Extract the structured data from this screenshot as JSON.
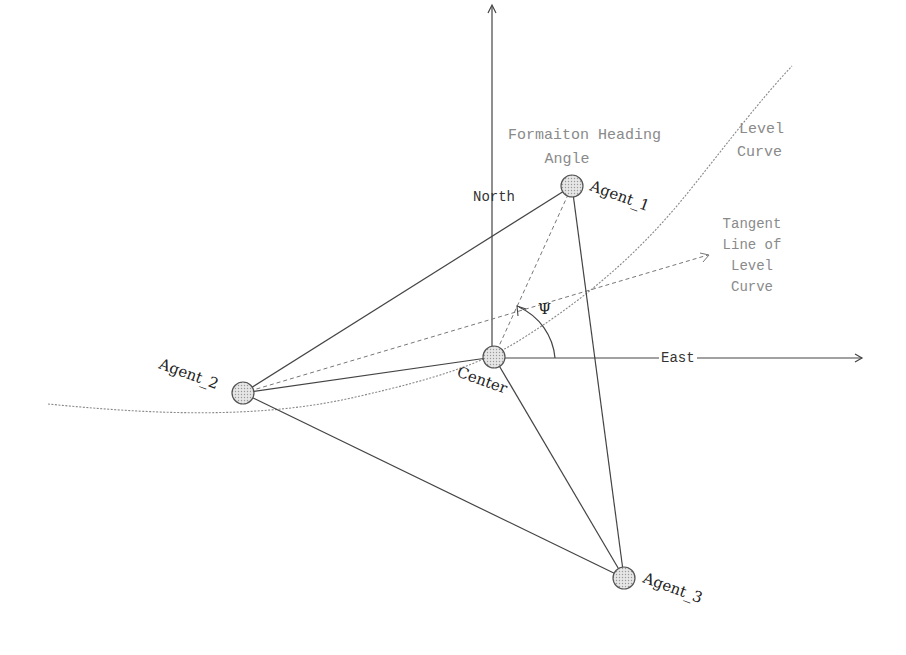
{
  "diagram": {
    "axes": {
      "north_label": "North",
      "east_label": "East"
    },
    "nodes": [
      {
        "id": "center",
        "label": "Center",
        "x": 494,
        "y": 357
      },
      {
        "id": "agent_1",
        "label": "Agent_1",
        "x": 572,
        "y": 186
      },
      {
        "id": "agent_2",
        "label": "Agent_2",
        "x": 243,
        "y": 393
      },
      {
        "id": "agent_3",
        "label": "Agent_3",
        "x": 624,
        "y": 578
      }
    ],
    "annotations": {
      "heading_line1": "Formaiton Heading",
      "heading_line2": "Angle",
      "level_curve_line1": "Level",
      "level_curve_line2": "Curve",
      "tangent_line1": "Tangent",
      "tangent_line2": "Line of",
      "tangent_line3": "Level",
      "tangent_line4": "Curve",
      "angle_symbol": "Ψ"
    },
    "colors": {
      "line": "#444444",
      "dashed": "#777777",
      "node_fill": "#d9d9d9",
      "light_text": "#8a8a8a"
    }
  }
}
